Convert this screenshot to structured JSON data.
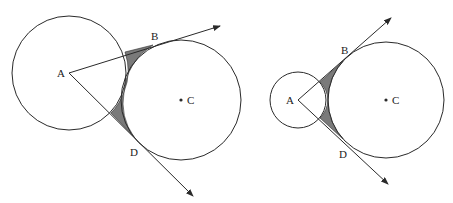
{
  "figures": [
    {
      "id": "left",
      "labels": {
        "A": "A",
        "B": "B",
        "C": "C",
        "D": "D"
      },
      "circle_A": {
        "cx": 69,
        "cy": 73,
        "r": 57
      },
      "circle_C": {
        "cx": 181,
        "cy": 100,
        "r": 60
      },
      "point_B": [
        153,
        45
      ],
      "point_D": [
        134,
        137
      ],
      "ray_AB_end": [
        220,
        26
      ],
      "ray_AD_end": [
        193,
        196
      ]
    },
    {
      "id": "right",
      "labels": {
        "A": "A",
        "B": "B",
        "C": "C",
        "D": "D"
      },
      "circle_A": {
        "cx": 298,
        "cy": 100,
        "r": 28
      },
      "circle_C": {
        "cx": 386,
        "cy": 100,
        "r": 58
      },
      "point_B": [
        349,
        54
      ],
      "point_D": [
        349,
        146
      ],
      "ray_AB_end": [
        391,
        18
      ],
      "ray_AD_end": [
        388,
        184
      ]
    }
  ],
  "colors": {
    "line": "#2a2a2a",
    "shade": "#7a7a7a",
    "background": "#ffffff"
  }
}
